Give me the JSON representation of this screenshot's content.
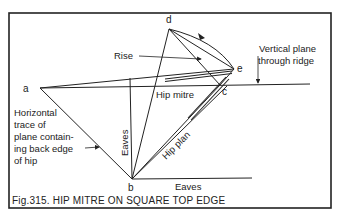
{
  "figure": {
    "caption": "Fig.315. HIP MITRE ON SQUARE TOP EDGE",
    "colors": {
      "ink": "#222222",
      "background": "#ffffff"
    }
  },
  "points": {
    "a": "a",
    "b": "b",
    "c": "c",
    "d": "d",
    "e": "e"
  },
  "labels": {
    "rise": "Rise",
    "vertical_plane_line1": "Vertical plane",
    "vertical_plane_line2": "through ridge",
    "hip_mitre": "Hip mitre",
    "hip_plan": "Hip plan",
    "eaves_vertical": "Eaves",
    "eaves_horizontal": "Eaves",
    "horizontal_trace": [
      "Horizontal",
      "trace of",
      "plane contain-",
      "ing back edge",
      "of hip"
    ]
  }
}
